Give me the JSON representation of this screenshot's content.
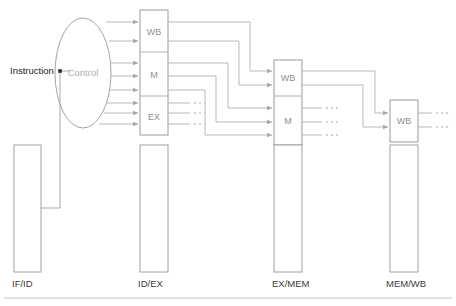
{
  "diagram": {
    "instruction_label": "Instruction",
    "control_label": "Control",
    "stages": [
      {
        "id": "if-id",
        "label": "IF/ID",
        "blocks": []
      },
      {
        "id": "id-ex",
        "label": "ID/EX",
        "blocks": [
          {
            "label": "WB",
            "inputs": 2,
            "outputs": 2,
            "dotted_outputs": false
          },
          {
            "label": "M",
            "inputs": 3,
            "outputs": 3,
            "dotted_outputs": false
          },
          {
            "label": "EX",
            "inputs": 3,
            "outputs": 3,
            "dotted_outputs": true
          }
        ]
      },
      {
        "id": "ex-mem",
        "label": "EX/MEM",
        "blocks": [
          {
            "label": "WB",
            "inputs": 2,
            "outputs": 2,
            "dotted_outputs": false
          },
          {
            "label": "M",
            "inputs": 3,
            "outputs": 3,
            "dotted_outputs": true
          }
        ]
      },
      {
        "id": "mem-wb",
        "label": "MEM/WB",
        "blocks": [
          {
            "label": "WB",
            "inputs": 2,
            "outputs": 2,
            "dotted_outputs": true
          }
        ]
      }
    ],
    "control_signal_count": 8,
    "colors": {
      "wire": "#b9b9b9",
      "box_outline": "#9a9a9a",
      "block_text": "#8f8f8f",
      "stage_text": "#3a3a3a",
      "control_text": "#b0b0b0",
      "background": "#ffffff"
    }
  }
}
